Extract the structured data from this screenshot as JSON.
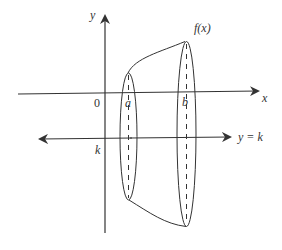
{
  "diagram": {
    "type": "solid of revolution",
    "labels": {
      "y_axis": "y",
      "x_axis": "x",
      "origin": "0",
      "curve": "f(x)",
      "a": "a",
      "b": "b",
      "k": "k",
      "line": "y = k"
    },
    "colors": {
      "stroke": "#333333",
      "background": "#ffffff"
    }
  }
}
